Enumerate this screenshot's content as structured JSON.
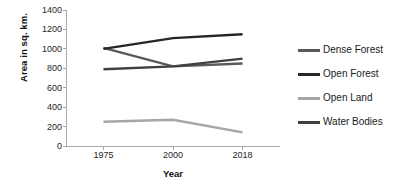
{
  "chart_data": {
    "type": "line",
    "title": "",
    "xlabel": "Year",
    "ylabel": "Area in sq. km.",
    "categories": [
      "1975",
      "2000",
      "2018"
    ],
    "ylim": [
      0,
      1400
    ],
    "ytick_step": 200,
    "yticks": [
      "1400",
      "1200",
      "1000",
      "800",
      "600",
      "400",
      "200",
      "0"
    ],
    "grid": false,
    "legend_position": "right",
    "series": [
      {
        "name": "Dense Forest",
        "values": [
          1010,
          820,
          850
        ],
        "color": "#595959"
      },
      {
        "name": "Open Forest",
        "values": [
          1000,
          1110,
          1150
        ],
        "color": "#262626"
      },
      {
        "name": "Open Land",
        "values": [
          250,
          270,
          140
        ],
        "color": "#a6a6a6"
      },
      {
        "name": "Water Bodies",
        "values": [
          790,
          820,
          900
        ],
        "color": "#404040"
      }
    ]
  },
  "axis": {
    "line_color": "#a9a9a9"
  }
}
